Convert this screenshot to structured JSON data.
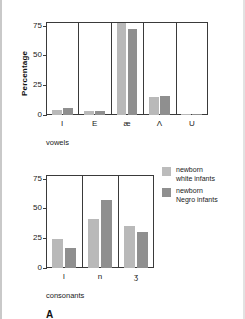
{
  "figure": {
    "panel_label": "A",
    "legend": {
      "entries": [
        {
          "swatch": "light",
          "line1": "newborn",
          "line2": "white infants",
          "color": "#bcbcbc"
        },
        {
          "swatch": "dark",
          "line1": "newborn",
          "line2": "Negro infants",
          "color": "#8f8f8f"
        }
      ]
    }
  },
  "chart_data": [
    {
      "type": "bar",
      "title": "",
      "xlabel": "vowels",
      "ylabel": "Percentage",
      "categories": [
        "I",
        "E",
        "æ",
        "Λ",
        "U"
      ],
      "ylim": [
        0,
        78
      ],
      "yticks": [
        0,
        25,
        50,
        75
      ],
      "ytick_labels": [
        "0",
        "25",
        "50",
        "75"
      ],
      "grid": false,
      "legend_position": "right",
      "series": [
        {
          "name": "newborn white infants",
          "color": "#b9b9b9",
          "values": [
            4,
            3,
            77,
            15,
            1
          ]
        },
        {
          "name": "newborn Negro infants",
          "color": "#8f8f8f",
          "values": [
            6,
            3,
            72,
            16,
            1
          ]
        }
      ]
    },
    {
      "type": "bar",
      "title": "",
      "xlabel": "consonants",
      "ylabel": "",
      "categories": [
        "l",
        "n",
        "ʒ"
      ],
      "ylim": [
        0,
        78
      ],
      "yticks": [
        0,
        25,
        50,
        75
      ],
      "ytick_labels": [
        "0",
        "25",
        "50",
        "75"
      ],
      "grid": false,
      "legend_position": "right",
      "series": [
        {
          "name": "newborn white infants",
          "color": "#b9b9b9",
          "values": [
            24,
            41,
            35
          ]
        },
        {
          "name": "newborn Negro infants",
          "color": "#8f8f8f",
          "values": [
            17,
            57,
            30
          ]
        }
      ]
    }
  ]
}
